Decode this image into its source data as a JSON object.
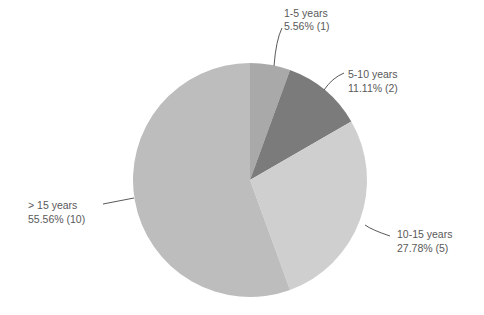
{
  "chart_data": {
    "type": "pie",
    "title": "",
    "categories": [
      "1-5 years",
      "5-10 years",
      "10-15 years",
      "> 15 years"
    ],
    "values": [
      1,
      2,
      5,
      10
    ],
    "percentages": [
      5.56,
      11.11,
      27.78,
      55.56
    ],
    "data_labels": [
      {
        "name": "1-5 years",
        "value_text": "5.56% (1)"
      },
      {
        "name": "5-10 years",
        "value_text": "11.11% (2)"
      },
      {
        "name": "10-15 years",
        "value_text": "27.78% (5)"
      },
      {
        "name": "> 15 years",
        "value_text": "55.56% (10)"
      }
    ],
    "colors": [
      "#a9a9a9",
      "#7b7b7b",
      "#cfcfcf",
      "#bdbdbd"
    ],
    "start_angle": "12 o'clock, clockwise",
    "legend": "none (data labels with leader lines)"
  }
}
